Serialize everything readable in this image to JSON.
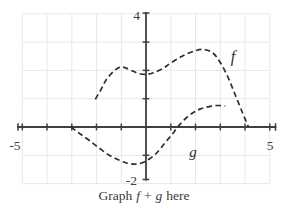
{
  "colors": {
    "background": "#ffffff",
    "grid": "#eae8e4",
    "axis": "#404040",
    "curve": "#2e2e2e",
    "text": "#3a3a3a"
  },
  "axis_labels": {
    "y_max": "4",
    "y_min": "-2",
    "x_min": "-5",
    "x_max": "5"
  },
  "curve_labels": {
    "f": "f",
    "g": "g"
  },
  "caption": {
    "graph": "Graph",
    "f": "f",
    "plus": "+",
    "g": "g",
    "here": "here"
  },
  "chart_data": {
    "type": "line",
    "title": "",
    "xlabel": "",
    "ylabel": "",
    "xlim": [
      -5,
      5
    ],
    "ylim": [
      -2,
      4
    ],
    "grid": true,
    "tick_labels_shown": {
      "x": [
        "-5",
        "5"
      ],
      "y": [
        "4",
        "-2"
      ]
    },
    "line_style": "dashed",
    "series": [
      {
        "name": "f",
        "points": [
          [
            -2.05,
            0.98
          ],
          [
            -1.8,
            1.35
          ],
          [
            -1.6,
            1.68
          ],
          [
            -1.3,
            1.97
          ],
          [
            -1.05,
            2.12
          ],
          [
            -0.85,
            2.1
          ],
          [
            -0.6,
            2.0
          ],
          [
            -0.3,
            1.89
          ],
          [
            0,
            1.86
          ],
          [
            0.3,
            1.92
          ],
          [
            0.65,
            2.05
          ],
          [
            1.0,
            2.26
          ],
          [
            1.5,
            2.52
          ],
          [
            2.0,
            2.7
          ],
          [
            2.35,
            2.74
          ],
          [
            2.7,
            2.62
          ],
          [
            3.0,
            2.28
          ],
          [
            3.3,
            1.78
          ],
          [
            3.6,
            1.15
          ],
          [
            3.9,
            0.5
          ],
          [
            4.13,
            0.02
          ]
        ]
      },
      {
        "name": "g",
        "points": [
          [
            -3.03,
            0
          ],
          [
            -2.7,
            -0.22
          ],
          [
            -2.3,
            -0.47
          ],
          [
            -1.9,
            -0.74
          ],
          [
            -1.5,
            -0.99
          ],
          [
            -1.1,
            -1.17
          ],
          [
            -0.75,
            -1.28
          ],
          [
            -0.45,
            -1.31
          ],
          [
            -0.15,
            -1.26
          ],
          [
            0.15,
            -1.12
          ],
          [
            0.45,
            -0.9
          ],
          [
            0.75,
            -0.58
          ],
          [
            1.05,
            -0.26
          ],
          [
            1.3,
            0.02
          ],
          [
            1.6,
            0.3
          ],
          [
            1.9,
            0.5
          ],
          [
            2.2,
            0.64
          ],
          [
            2.55,
            0.72
          ],
          [
            2.9,
            0.76
          ],
          [
            3.2,
            0.74
          ]
        ]
      }
    ]
  }
}
